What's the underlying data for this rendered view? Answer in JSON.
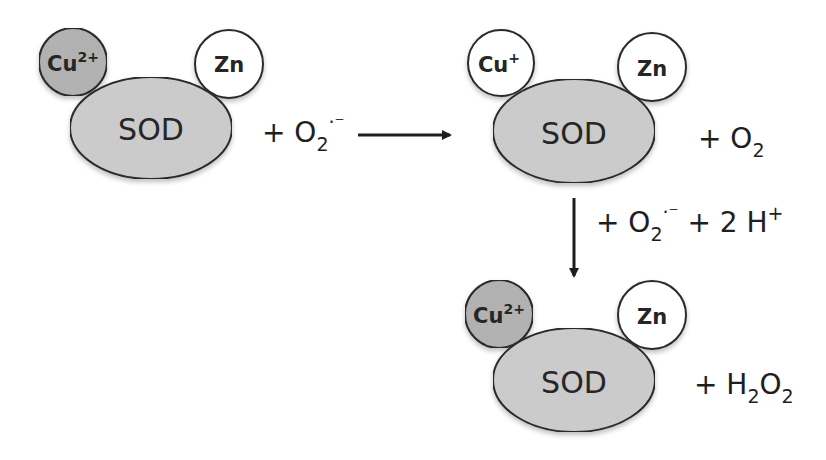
{
  "colors": {
    "background": "#ffffff",
    "enzyme_fill": "#cfcfcf",
    "cu2_fill": "#b5b5b5",
    "white_fill": "#ffffff",
    "stroke": "#2a2a2a",
    "text": "#262626"
  },
  "states": [
    {
      "id": "state-1",
      "enzyme": "SOD",
      "copper": {
        "base": "Cu",
        "charge": "2+",
        "oxidized": true
      },
      "zinc": "Zn",
      "reactant": {
        "prefix": "+ O",
        "sub": "2",
        "sup": "·⁻"
      }
    },
    {
      "id": "state-2",
      "enzyme": "SOD",
      "copper": {
        "base": "Cu",
        "charge": "+",
        "oxidized": false
      },
      "zinc": "Zn",
      "product": {
        "prefix": "+ O",
        "sub": "2"
      }
    },
    {
      "id": "state-3",
      "enzyme": "SOD",
      "copper": {
        "base": "Cu",
        "charge": "2+",
        "oxidized": true
      },
      "zinc": "Zn",
      "product": {
        "prefix": "+ H",
        "sub1": "2",
        "mid": "O",
        "sub2": "2"
      }
    }
  ],
  "arrows": [
    {
      "id": "arrow-1",
      "direction": "right"
    },
    {
      "id": "arrow-2",
      "direction": "down",
      "label": {
        "p1": "+ O",
        "sub": "2",
        "sup": "·⁻",
        "p2": " + 2 H",
        "sup2": "+"
      }
    }
  ]
}
